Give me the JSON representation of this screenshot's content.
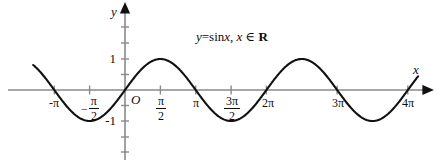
{
  "figure": {
    "background_color": "#ffffff",
    "curve_color": "#111111",
    "axis_color": "#8a8a8a",
    "text_color": "#0d0d0d"
  },
  "annotation": {
    "equation_y": "y",
    "equation_eq": "=sin",
    "equation_x1": "x",
    "equation_comma": ", ",
    "equation_x2": "x",
    "equation_in": " ∈ ",
    "equation_set": "R",
    "equation_full": "y=sinx, x ∈ R"
  },
  "axes": {
    "x_label": "x",
    "y_label": "y",
    "origin_label": "O",
    "x_ticks": [
      {
        "label": "-π",
        "value": -3.14159,
        "type": "plain"
      },
      {
        "label": "-π/2",
        "value": -1.5708,
        "type": "fraction",
        "sign": "−",
        "numerator": "π",
        "denominator": "2"
      },
      {
        "label": "π/2",
        "value": 1.5708,
        "type": "fraction",
        "sign": "",
        "numerator": "π",
        "denominator": "2"
      },
      {
        "label": "π",
        "value": 3.14159,
        "type": "plain"
      },
      {
        "label": "3π/2",
        "value": 4.71239,
        "type": "fraction",
        "sign": "",
        "numerator": "3π",
        "denominator": "2"
      },
      {
        "label": "2π",
        "value": 6.28319,
        "type": "plain"
      },
      {
        "label": "3π",
        "value": 9.42478,
        "type": "plain"
      },
      {
        "label": "4π",
        "value": 12.56637,
        "type": "plain"
      }
    ],
    "y_ticks": [
      {
        "label": "1",
        "value": 1
      },
      {
        "label": "-1",
        "value": -1
      }
    ]
  },
  "chart_data": {
    "type": "line",
    "title": "",
    "subtitle": "",
    "annotation_text": "y=sinx, x ∈ R",
    "xlabel": "x",
    "ylabel": "y",
    "xlim": [
      -4.3,
      14.1
    ],
    "ylim": [
      -1.75,
      1.75
    ],
    "grid": false,
    "legend": false,
    "legend_position": "none",
    "function": "y = sin(x)",
    "domain": "x ∈ R",
    "x_tick_values": [
      -3.14159,
      -1.5708,
      1.5708,
      3.14159,
      4.71239,
      6.28319,
      9.42478,
      12.56637
    ],
    "x_tick_labels": [
      "-π",
      "-π/2",
      "π/2",
      "π",
      "3π/2",
      "2π",
      "3π",
      "4π"
    ],
    "y_tick_values": [
      1,
      -1
    ],
    "y_tick_labels": [
      "1",
      "-1"
    ],
    "series": [
      {
        "name": "y = sin x",
        "x": [
          -4.2,
          -3.9,
          -3.6,
          -3.3,
          -3.14159,
          -2.9,
          -2.6,
          -2.3,
          -2.0,
          -1.5708,
          -1.2,
          -0.9,
          -0.6,
          -0.3,
          0.0,
          0.3,
          0.6,
          0.9,
          1.2,
          1.5708,
          1.9,
          2.2,
          2.5,
          2.8,
          3.14159,
          3.5,
          3.8,
          4.1,
          4.4,
          4.71239,
          5.0,
          5.3,
          5.6,
          5.9,
          6.28319,
          6.6,
          6.9,
          7.2,
          7.5,
          7.85398,
          8.2,
          8.5,
          8.8,
          9.1,
          9.42478,
          9.8,
          10.1,
          10.4,
          10.7,
          10.99557,
          11.3,
          11.6,
          11.9,
          12.2,
          12.56637,
          12.9,
          13.2,
          13.5,
          13.8
        ],
        "y": [
          0.872,
          0.688,
          0.443,
          0.158,
          0.0,
          -0.239,
          -0.516,
          -0.746,
          -0.909,
          -1.0,
          -0.932,
          -0.783,
          -0.565,
          -0.296,
          0.0,
          0.296,
          0.565,
          0.783,
          0.932,
          1.0,
          0.946,
          0.808,
          0.599,
          0.335,
          0.0,
          -0.351,
          -0.612,
          -0.818,
          -0.952,
          -1.0,
          -0.959,
          -0.832,
          -0.631,
          -0.374,
          0.0,
          0.311,
          0.579,
          0.794,
          0.938,
          1.0,
          0.942,
          0.798,
          0.585,
          0.319,
          0.0,
          -0.366,
          -0.625,
          -0.827,
          -0.956,
          -1.0,
          -0.956,
          -0.837,
          -0.639,
          -0.384,
          0.0,
          0.327,
          0.592,
          0.804,
          0.943
        ]
      }
    ]
  }
}
